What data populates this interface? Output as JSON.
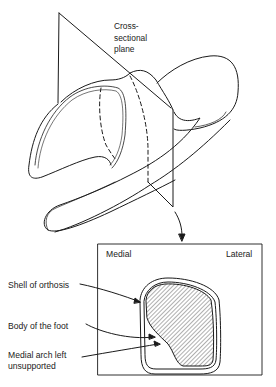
{
  "figure": {
    "upper_view": {
      "plane_label": "Cross-\nsectional\nplane",
      "parts": [
        "cross-sectional-plane",
        "orthosis-shell",
        "foot",
        "section-line",
        "view-arrow"
      ]
    },
    "section_view": {
      "side_labels": {
        "left": "Medial",
        "right": "Lateral"
      },
      "callouts": [
        {
          "id": "shell",
          "label": "Shell of orthosis"
        },
        {
          "id": "body",
          "label": "Body of the foot"
        },
        {
          "id": "arch",
          "label": "Medial arch left\nunsupported"
        }
      ]
    },
    "caption": ""
  },
  "colors": {
    "line": "#1a1a1a",
    "background": "#ffffff"
  }
}
